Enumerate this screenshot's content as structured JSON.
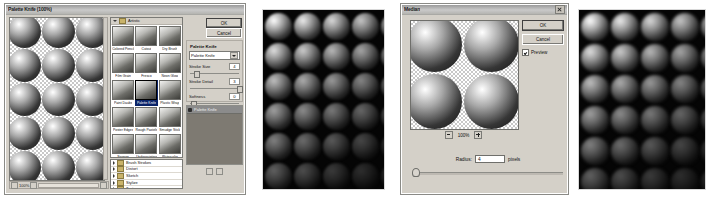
{
  "figure": {
    "background": "#ffffff",
    "panel_count": 4
  },
  "gallery_dialog": {
    "title": "Palette Knife (100%)",
    "preview_zoom": "100%",
    "ok_label": "OK",
    "cancel_label": "Cancel",
    "controls": {
      "heading": "Palette Knife",
      "filter_selected": "Palette Knife",
      "sliders": [
        {
          "label": "Stroke Size",
          "value": "4"
        },
        {
          "label": "Stroke Detail",
          "value": "3"
        },
        {
          "label": "Softness",
          "value": "0"
        }
      ]
    },
    "open_category": "Artistic",
    "thumbnails": [
      {
        "label": "Colored Pencil"
      },
      {
        "label": "Cutout"
      },
      {
        "label": "Dry Brush"
      },
      {
        "label": "Film Grain"
      },
      {
        "label": "Fresco"
      },
      {
        "label": "Neon Glow"
      },
      {
        "label": "Paint Daubs"
      },
      {
        "label": "Palette Knife"
      },
      {
        "label": "Plastic Wrap"
      },
      {
        "label": "Poster Edges"
      },
      {
        "label": "Rough Pastels"
      },
      {
        "label": "Smudge Stick"
      },
      {
        "label": "Sponge"
      },
      {
        "label": "Underpainting"
      },
      {
        "label": "Watercolor"
      }
    ],
    "selected_thumbnail": "Palette Knife",
    "categories": [
      {
        "label": "Brush Strokes"
      },
      {
        "label": "Distort"
      },
      {
        "label": "Sketch"
      },
      {
        "label": "Stylize"
      },
      {
        "label": "Texture"
      }
    ],
    "effect_layers": [
      {
        "label": "Palette Knife"
      }
    ]
  },
  "result_palette": {
    "caption": "Palette Knife result",
    "background": "#050505"
  },
  "median_dialog": {
    "title": "Median",
    "ok_label": "OK",
    "cancel_label": "Cancel",
    "preview_label": "Preview",
    "preview_checked": true,
    "zoom_value": "100%",
    "zoom_out_icon": "minus-icon",
    "zoom_in_icon": "plus-icon",
    "radius_label": "Radius:",
    "radius_value": "4",
    "radius_units": "pixels"
  },
  "result_median": {
    "caption": "Median result",
    "background": "#050505"
  }
}
